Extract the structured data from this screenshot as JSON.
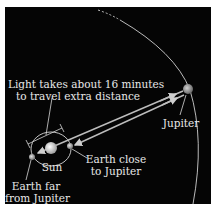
{
  "diagram": {
    "colors": {
      "background": "#050505",
      "border": "#ffffff",
      "lines": "#d8d8d8",
      "text": "#e8e8e8",
      "sun": "#e6e6e6",
      "earth": "#b8b8b8",
      "jupiter": "#a8a8a8"
    },
    "labels": {
      "light_line1": "Light takes about 16 minutes",
      "light_line2": "to travel extra distance",
      "jupiter": "Jupiter",
      "sun": "Sun",
      "earth_close_line1": "Earth close",
      "earth_close_line2": "to Jupiter",
      "earth_far_line1": "Earth far",
      "earth_far_line2": "from Jupiter"
    },
    "bodies": [
      {
        "name": "Sun",
        "cx": 51,
        "cy": 148,
        "r": 6
      },
      {
        "name": "Earth close to Jupiter",
        "cx": 70,
        "cy": 146,
        "r": 3
      },
      {
        "name": "Earth far from Jupiter",
        "cx": 32,
        "cy": 157,
        "r": 3
      },
      {
        "name": "Jupiter",
        "cx": 188,
        "cy": 89,
        "r": 5
      }
    ],
    "orbits": [
      {
        "name": "Earth orbit",
        "type": "ellipse"
      },
      {
        "name": "Jupiter orbit",
        "type": "arc"
      }
    ],
    "arrows": [
      {
        "from": "Jupiter",
        "to": "Earth far from Jupiter"
      },
      {
        "from": "Jupiter",
        "to": "Earth close to Jupiter"
      }
    ]
  }
}
